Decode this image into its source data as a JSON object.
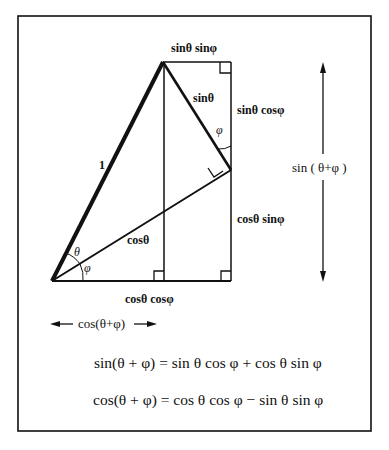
{
  "diagram": {
    "colors": {
      "stroke": "#111111",
      "background": "#ffffff"
    },
    "labels": {
      "top_segment": "sinθ sinφ",
      "hypotenuse_one": "1",
      "sin_theta_side": "sinθ",
      "right_upper_segment": "sinθ cosφ",
      "right_lower_segment": "cosθ sinφ",
      "cos_theta_side": "cosθ",
      "bottom_segment": "cosθ cosφ",
      "angle_theta": "θ",
      "angle_phi_bottom": "φ",
      "angle_phi_top": "φ",
      "vertical_arrow_label": "sin ( θ+φ )",
      "horizontal_arrow_label": "cos(θ+φ)"
    },
    "equations": [
      "sin(θ + φ) = sin θ cos φ + cos θ sin φ",
      "cos(θ + φ) = cos θ cos φ − sin θ sin φ"
    ]
  }
}
